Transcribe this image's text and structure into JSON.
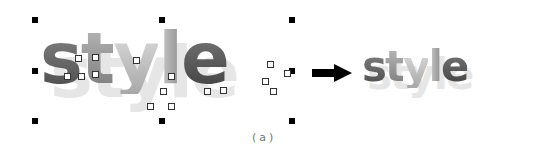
{
  "figure": {
    "before_word": "style",
    "after_word": "style",
    "caption": "(a)",
    "arrow_direction": "right",
    "colors": {
      "handle": "#000000",
      "shadow": "#e6e6e6",
      "dark_letter": "#4a4a4a",
      "light_letter": "#e2e2e2"
    },
    "letters": [
      "s",
      "t",
      "y",
      "l",
      "e"
    ],
    "selection_handles": 8
  }
}
